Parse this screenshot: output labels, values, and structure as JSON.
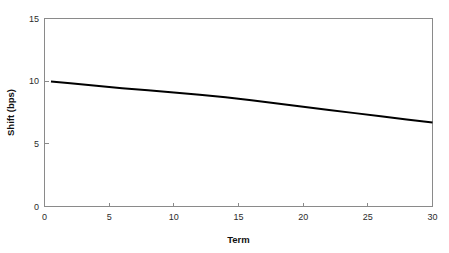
{
  "chart_data": {
    "type": "line",
    "title": "",
    "subtitle": "",
    "xlabel": "Term",
    "ylabel": "Shift (bps)",
    "xlim": [
      0,
      30
    ],
    "ylim": [
      0,
      15
    ],
    "xticks": [
      0,
      5,
      10,
      15,
      20,
      25,
      30
    ],
    "xtick_labels": [
      "0",
      "5",
      "10",
      "15",
      "20",
      "25",
      "30"
    ],
    "yticks": [
      0,
      5,
      10,
      15
    ],
    "ytick_labels": [
      "0",
      "5",
      "10",
      "15"
    ],
    "grid": false,
    "legend": false,
    "legend_position": "none",
    "series": [
      {
        "name": "Shift",
        "color": "#000000",
        "x": [
          0.5,
          2,
          4,
          6,
          8,
          10,
          12,
          14,
          16,
          18,
          20,
          22,
          24,
          26,
          28,
          30
        ],
        "values": [
          9.98,
          9.83,
          9.63,
          9.44,
          9.27,
          9.1,
          8.92,
          8.72,
          8.47,
          8.21,
          7.95,
          7.7,
          7.45,
          7.2,
          6.95,
          6.7
        ]
      }
    ],
    "annotations": []
  },
  "axes": {
    "x_title": "Term",
    "y_title": "Shift (bps)"
  },
  "colors": {
    "series": "#000000",
    "axis": "#8a8a8a",
    "text": "#2b2b2b",
    "background": "#ffffff"
  }
}
